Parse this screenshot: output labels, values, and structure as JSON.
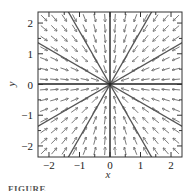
{
  "chart_data": {
    "type": "vector_field",
    "title": "",
    "xlabel": "x",
    "ylabel": "y",
    "xlim": [
      -2.36,
      2.36
    ],
    "ylim": [
      -2.36,
      2.36
    ],
    "x_ticks": [
      -2,
      -1,
      0,
      1,
      2
    ],
    "y_ticks": [
      -2,
      -1,
      0,
      1,
      2
    ],
    "x_tick_labels": [
      "−2",
      "−1",
      "0",
      "1",
      "2"
    ],
    "y_tick_labels": [
      "−2",
      "−1",
      "0",
      "1",
      "2"
    ],
    "minor_ticks": [
      -1.5,
      -0.5,
      0.5,
      1.5
    ],
    "grid": false,
    "legend": null,
    "field": {
      "description": "Stable star node: direction field points toward the origin (dx/dt = -x, dy/dt = -y)",
      "dx": "-x",
      "dy": "-y",
      "grid_values": [
        -2.167,
        -1.833,
        -1.5,
        -1.167,
        -0.833,
        -0.5,
        -0.167,
        0.167,
        0.5,
        0.833,
        1.167,
        1.5,
        1.833,
        2.167
      ],
      "arrow_length_px": 8
    },
    "trajectories": {
      "description": "Straight-line trajectories through the origin at every 30 degrees",
      "angles_deg": [
        0,
        30,
        60,
        90,
        120,
        150
      ]
    }
  },
  "caption": {
    "text": "FIGURE"
  },
  "colors": {
    "arrow": "#555555",
    "trajectory": "#555555",
    "axis": "#222222",
    "frame": "#333333"
  }
}
